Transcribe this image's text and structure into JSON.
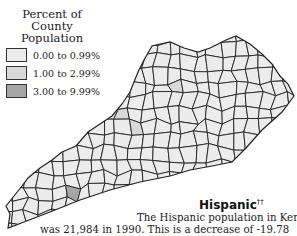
{
  "legend": {
    "title_line1": "Percent of",
    "title_line2": "County Population",
    "items": [
      {
        "label": "0.00 to 0.99%",
        "color": "#ececec"
      },
      {
        "label": "1.00 to 2.99%",
        "color": "#d9d9d9"
      },
      {
        "label": "3.00 to 9.99%",
        "color": "#a6a6a6"
      }
    ]
  },
  "map": {
    "region": "Kentucky",
    "border_color": "#222222",
    "highlighted_counties": [
      {
        "category": "1.00 to 2.99%",
        "location": "north-central"
      },
      {
        "category": "1.00 to 2.99%",
        "location": "central-west"
      },
      {
        "category": "1.00 to 2.99%",
        "location": "north-central-west"
      },
      {
        "category": "3.00 to 9.99%",
        "location": "south-west"
      }
    ]
  },
  "section": {
    "title": "Hispanic",
    "title_mark": "††",
    "text_line1": "The Hispanic population in Kentucky",
    "text_line2": "was 21,984 in 1990. This is a decrease of -19.78"
  }
}
